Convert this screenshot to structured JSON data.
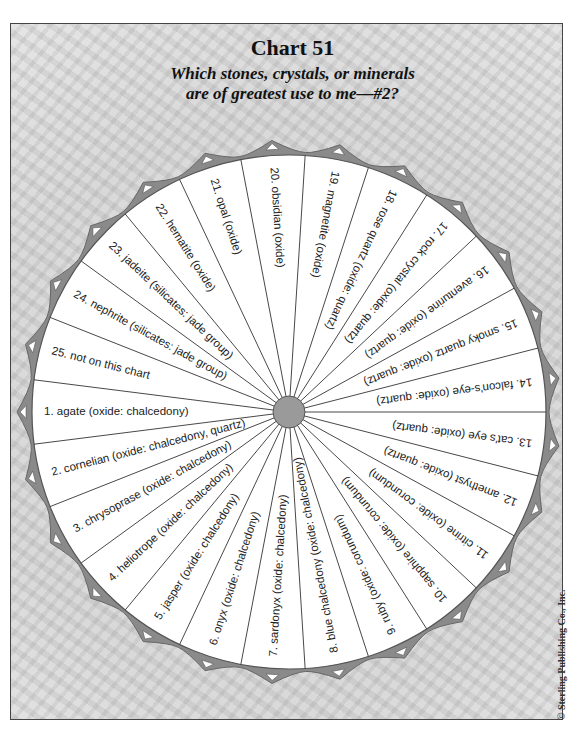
{
  "header": {
    "title": "Chart 51",
    "subtitle_line1": "Which stones, crystals, or minerals",
    "subtitle_line2": "are of greatest use to me—#2?"
  },
  "copyright": "© Sterling Publishing Co., Inc.",
  "colors": {
    "wheel_fill": "#ffffff",
    "rim": "#8a8a8a",
    "hub": "#9a9a9a",
    "line": "#333333"
  },
  "wheel": {
    "center_x": 289,
    "center_y": 412,
    "radius": 257,
    "hub_radius": 16,
    "segments": [
      {
        "n": 1,
        "label": "1.  agate (oxide: chalcedony)"
      },
      {
        "n": 2,
        "label": "2.  cornelian (oxide: chalcedony, quartz)"
      },
      {
        "n": 3,
        "label": "3.  chrysoprase (oxide: chalcedony)"
      },
      {
        "n": 4,
        "label": "4.  heliotrope (oxide: chalcedony)"
      },
      {
        "n": 5,
        "label": "5.  jasper (oxide: chalcedony)"
      },
      {
        "n": 6,
        "label": "6.  onyx (oxide: chalcedony)"
      },
      {
        "n": 7,
        "label": "7.  sardonyx (oxide: chalcedony)"
      },
      {
        "n": 8,
        "label": "8.  blue chalcedony (oxide: chalcedony)"
      },
      {
        "n": 9,
        "label": "9.  ruby (oxide: corundum)"
      },
      {
        "n": 10,
        "label": "10.  sapphire (oxide: corundum)"
      },
      {
        "n": 11,
        "label": "11.  citrine (oxide: corundum)"
      },
      {
        "n": 12,
        "label": "12.  amethyst (oxide: quartz)"
      },
      {
        "n": 13,
        "label": "13.  cat's eye (oxide: quartz)"
      },
      {
        "n": 14,
        "label": "14.  falcon's-eye (oxide: quartz)"
      },
      {
        "n": 15,
        "label": "15.  smoky quartz (oxide: quartz)"
      },
      {
        "n": 16,
        "label": "16.  aventurine (oxide: quartz)"
      },
      {
        "n": 17,
        "label": "17.  rock crystal (oxide: quartz)"
      },
      {
        "n": 18,
        "label": "18.  rose quartz (oxide: quartz)"
      },
      {
        "n": 19,
        "label": "19.  magnetite (oxide)"
      },
      {
        "n": 20,
        "label": "20.  obsidian (oxide)"
      },
      {
        "n": 21,
        "label": "21.  opal (oxide)"
      },
      {
        "n": 22,
        "label": "22.  hematite (oxide)"
      },
      {
        "n": 23,
        "label": "23.  jadeite (silicates: jade group)"
      },
      {
        "n": 24,
        "label": "24.  nephrite (silicates: jade group)"
      },
      {
        "n": 25,
        "label": "25.  not on this chart"
      }
    ]
  }
}
